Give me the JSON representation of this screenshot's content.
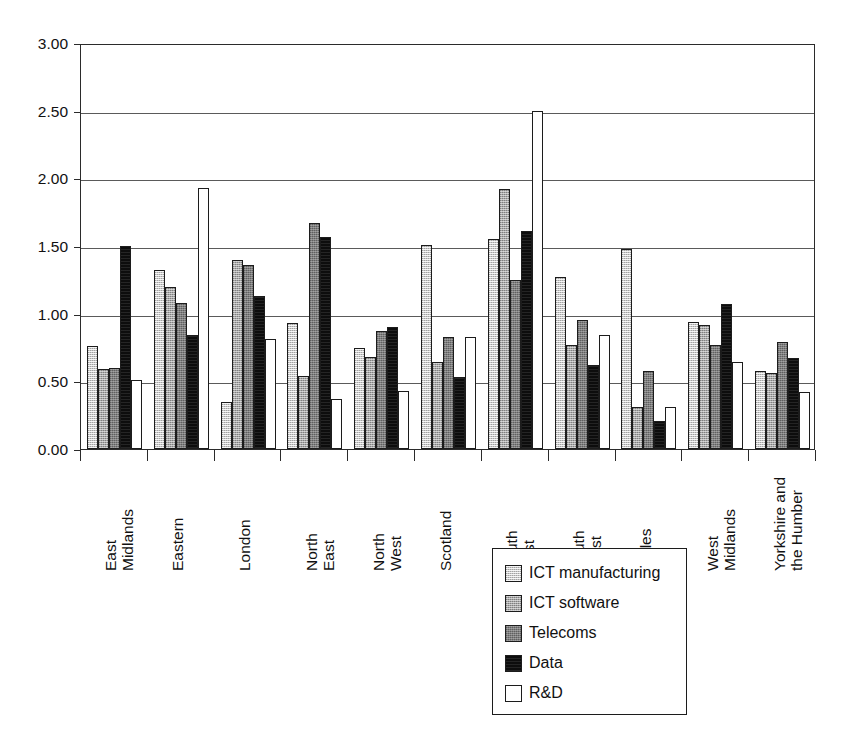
{
  "chart_data": {
    "type": "bar",
    "title": "",
    "xlabel": "",
    "ylabel": "",
    "ylim": [
      0,
      3.0
    ],
    "ytick_values": [
      0.0,
      0.5,
      1.0,
      1.5,
      2.0,
      2.5,
      3.0
    ],
    "ytick_labels": [
      "0.00",
      "0.50",
      "1.00",
      "1.50",
      "2.00",
      "2.50",
      "3.00"
    ],
    "grid": true,
    "legend_position": "bottom-center",
    "categories": [
      "East Midlands",
      "Eastern",
      "London",
      "North East",
      "North West",
      "Scotland",
      "South East",
      "South West",
      "Wales",
      "West Midlands",
      "Yorkshire and the Humber"
    ],
    "category_lines": [
      [
        "East",
        "Midlands"
      ],
      [
        "Eastern",
        ""
      ],
      [
        "London",
        ""
      ],
      [
        "North",
        "East"
      ],
      [
        "North",
        "West"
      ],
      [
        "Scotland",
        ""
      ],
      [
        "South",
        "East"
      ],
      [
        "South",
        "West"
      ],
      [
        "Wales",
        ""
      ],
      [
        "West",
        "Midlands"
      ],
      [
        "Yorkshire and",
        "the Humber"
      ]
    ],
    "series": [
      {
        "name": "ICT manufacturing",
        "color": "#c9c9c9",
        "values": [
          0.76,
          1.32,
          0.35,
          0.93,
          0.75,
          1.51,
          1.55,
          1.27,
          1.48,
          0.94,
          0.58
        ]
      },
      {
        "name": "ICT software",
        "color": "#a6a6a6",
        "values": [
          0.59,
          1.2,
          1.4,
          0.54,
          0.68,
          0.64,
          1.92,
          0.77,
          0.31,
          0.92,
          0.56
        ]
      },
      {
        "name": "Telecoms",
        "color": "#7d7d7d",
        "values": [
          0.6,
          1.08,
          1.36,
          1.67,
          0.87,
          0.83,
          1.25,
          0.95,
          0.58,
          0.77,
          0.79
        ]
      },
      {
        "name": "Data",
        "color": "#0d0d0d",
        "values": [
          1.5,
          0.84,
          1.13,
          1.57,
          0.9,
          0.53,
          1.61,
          0.62,
          0.21,
          1.07,
          0.67
        ]
      },
      {
        "name": "R&D",
        "color": "#ffffff",
        "values": [
          0.51,
          1.93,
          0.81,
          0.37,
          0.43,
          0.83,
          2.5,
          0.84,
          0.31,
          0.64,
          0.42
        ]
      }
    ]
  },
  "legend": {
    "items": [
      {
        "label": "ICT manufacturing",
        "swatch": "s-ictman"
      },
      {
        "label": "ICT software",
        "swatch": "s-ictsw"
      },
      {
        "label": "Telecoms",
        "swatch": "s-telecoms"
      },
      {
        "label": "Data",
        "swatch": "s-data"
      },
      {
        "label": "R&D",
        "swatch": "s-rnd"
      }
    ]
  },
  "axis": {
    "y_max_label": "3.00",
    "y_min_label": "0.00"
  }
}
